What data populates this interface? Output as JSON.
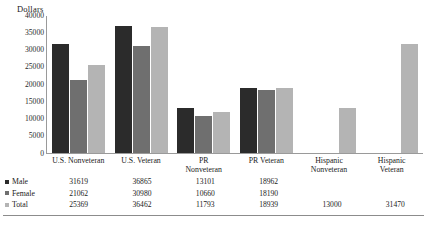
{
  "chart_data": {
    "type": "bar",
    "title": "",
    "ylabel": "Dollars",
    "xlabel": "",
    "ylim": [
      0,
      40000
    ],
    "yticks": [
      "0",
      "5000",
      "10000",
      "15000",
      "20000",
      "25000",
      "30000",
      "35000",
      "40000"
    ],
    "grid": false,
    "legend_position": "bottom-table",
    "categories": [
      {
        "line1": "U.S. Nonveteran",
        "line2": ""
      },
      {
        "line1": "U.S. Veteran",
        "line2": ""
      },
      {
        "line1": "PR",
        "line2": "Nonveteran"
      },
      {
        "line1": "PR  Veteran",
        "line2": ""
      },
      {
        "line1": "Hispanic",
        "line2": "Nonveteran"
      },
      {
        "line1": "Hispanic",
        "line2": "Veteran"
      }
    ],
    "series": [
      {
        "name": "Male",
        "color": "#2b2b2b",
        "values": [
          31619,
          21062,
          13101,
          18962,
          null,
          null
        ],
        "labels": [
          "31619",
          "21062",
          "13101",
          "18962",
          "",
          ""
        ]
      },
      {
        "name": "Female",
        "color": "#6f6f6f",
        "values": [
          21062,
          30980,
          10660,
          18190,
          null,
          null
        ],
        "labels": [
          "21062",
          "30980",
          "10660",
          "18190",
          "",
          ""
        ]
      },
      {
        "name": "Total",
        "color": "#b4b4b4",
        "values": [
          25369,
          36462,
          11793,
          18939,
          13000,
          31470
        ],
        "labels": [
          "25369",
          "36462",
          "11793",
          "18939",
          "13000",
          "31470"
        ]
      }
    ],
    "table_rows": [
      {
        "label": "Male",
        "swatch": "male",
        "values": [
          "31619",
          "36865",
          "13101",
          "18962",
          "",
          ""
        ]
      },
      {
        "label": "Female",
        "swatch": "female",
        "values": [
          "21062",
          "30980",
          "10660",
          "18190",
          "",
          ""
        ]
      },
      {
        "label": "Total",
        "swatch": "total",
        "values": [
          "25369",
          "36462",
          "11793",
          "18939",
          "13000",
          "31470"
        ]
      }
    ],
    "plotted_values": [
      {
        "male": 31619,
        "female": 21062,
        "total": 25369
      },
      {
        "male": 36865,
        "female": 30980,
        "total": 36462
      },
      {
        "male": 13101,
        "female": 10660,
        "total": 11793
      },
      {
        "male": 18962,
        "female": 18190,
        "total": 18939
      },
      {
        "male": null,
        "female": null,
        "total": 13000
      },
      {
        "male": null,
        "female": null,
        "total": 31470
      }
    ]
  }
}
